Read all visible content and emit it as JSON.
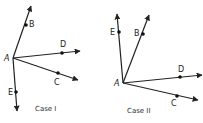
{
  "figure": {
    "cases": [
      {
        "caption": "Case I",
        "vertex": {
          "label": "A",
          "x": 13,
          "y": 58,
          "lx": 4,
          "ly": 61
        },
        "rays": [
          {
            "label": "B",
            "end": [
              31,
              6
            ],
            "dot": [
              26,
              25
            ],
            "lbl": [
              29,
              27
            ]
          },
          {
            "label": "D",
            "end": [
              80,
              51
            ],
            "dot": [
              62,
              53
            ],
            "lbl": [
              60,
              47
            ]
          },
          {
            "label": "C",
            "end": [
              78,
              80
            ],
            "dot": [
              58,
              73
            ],
            "lbl": [
              54,
              85
            ]
          },
          {
            "label": "E",
            "end": [
              17,
              111
            ],
            "dot": [
              16,
              92
            ],
            "lbl": [
              8,
              95
            ]
          }
        ],
        "caption_pos": [
          35,
          111
        ]
      },
      {
        "caption": "Case II",
        "vertex": {
          "label": "A",
          "x": 123,
          "y": 83,
          "lx": 114,
          "ly": 86
        },
        "rays": [
          {
            "label": "E",
            "end": [
              117,
              14
            ],
            "dot": [
              119,
              32
            ],
            "lbl": [
              110,
              35
            ]
          },
          {
            "label": "B",
            "end": [
              149,
              15
            ],
            "dot": [
              143,
              34
            ],
            "lbl": [
              134,
              36
            ]
          },
          {
            "label": "D",
            "end": [
              202,
              75
            ],
            "dot": [
              180,
              77
            ],
            "lbl": [
              178,
              72
            ]
          },
          {
            "label": "C",
            "end": [
              198,
              100
            ],
            "dot": [
              177,
              96
            ],
            "lbl": [
              171,
              106
            ]
          }
        ],
        "caption_pos": [
          127,
          113
        ]
      }
    ]
  }
}
